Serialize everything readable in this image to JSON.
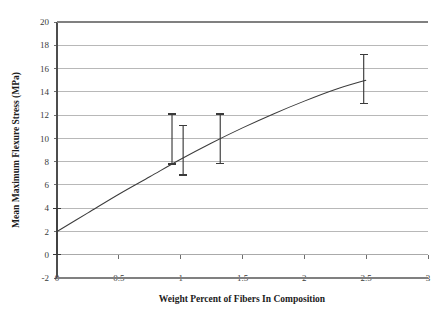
{
  "chart_data": {
    "type": "line",
    "title": "",
    "xlabel": "Weight Percent of Fibers In Composition",
    "ylabel": "Mean Maximum Flexure Stress (MPa)",
    "xlim": [
      0,
      3
    ],
    "ylim": [
      -2,
      20
    ],
    "grid": "horizontal",
    "legend": "none",
    "xticks": [
      "0",
      "0.5",
      "1",
      "1.5",
      "2",
      "2.5",
      "3"
    ],
    "xtick_values": [
      0,
      0.5,
      1,
      1.5,
      2,
      2.5,
      3
    ],
    "yticks": [
      "-2",
      "0",
      "2",
      "4",
      "6",
      "8",
      "10",
      "12",
      "14",
      "16",
      "18",
      "20"
    ],
    "ytick_values": [
      -2,
      0,
      2,
      4,
      6,
      8,
      10,
      12,
      14,
      16,
      18,
      20
    ],
    "series": [
      {
        "name": "Mean Maximum Flexure Stress",
        "x": [
          0,
          0.25,
          0.5,
          0.75,
          1,
          1.25,
          1.5,
          1.75,
          2,
          2.25,
          2.5
        ],
        "values": [
          2.0,
          3.6,
          5.2,
          6.7,
          8.2,
          9.6,
          10.9,
          12.1,
          13.2,
          14.2,
          15.0
        ]
      }
    ],
    "error_bars": [
      {
        "x": 0,
        "y": 2.0,
        "low": 0.0,
        "high": 4.0
      },
      {
        "x": 0.93,
        "y": 9.2,
        "low": 7.8,
        "high": 12.1
      },
      {
        "x": 1.02,
        "y": 9.0,
        "low": 6.85,
        "high": 11.1
      },
      {
        "x": 1.32,
        "y": 10.0,
        "low": 7.85,
        "high": 12.1
      },
      {
        "x": 2.48,
        "y": 15.0,
        "low": 13.0,
        "high": 17.2
      }
    ],
    "colors": {
      "curve": "#3c3c3c",
      "gridline": "#a6a6a6",
      "axis": "#808080",
      "error_bar": "#3a3a3a",
      "text": "#1b1b1b",
      "background": "#ffffff"
    }
  }
}
